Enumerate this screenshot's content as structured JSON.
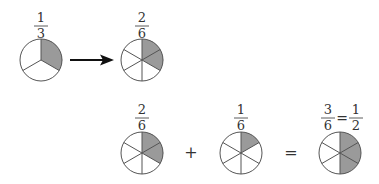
{
  "colors": {
    "shade": "#9a9a9a",
    "stroke": "#555555",
    "text": "#333333"
  },
  "top_row": {
    "left": {
      "numerator": "1",
      "denominator": "3",
      "slices": 3,
      "shaded": 1
    },
    "arrow": "right-arrow",
    "right": {
      "numerator": "2",
      "denominator": "6",
      "slices": 6,
      "shaded": 2
    }
  },
  "bottom_row": {
    "term1": {
      "numerator": "2",
      "denominator": "6",
      "slices": 6,
      "shaded": 2
    },
    "plus": "+",
    "term2": {
      "numerator": "1",
      "denominator": "6",
      "slices": 6,
      "shaded": 1
    },
    "equals": "=",
    "result": {
      "numerator": "3",
      "denominator": "6",
      "eq": "=",
      "simplified_numerator": "1",
      "simplified_denominator": "2",
      "slices": 6,
      "shaded": 3
    }
  }
}
